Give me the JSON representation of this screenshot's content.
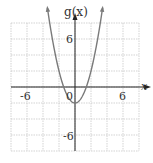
{
  "chart_data": {
    "type": "line",
    "title": "",
    "function_label": "g(x)",
    "xlabel": "x",
    "ylabel": "g(x)",
    "xlim": [
      -8,
      8
    ],
    "ylim": [
      -8,
      8
    ],
    "grid": true,
    "grid_step": 2,
    "x_tick_labels": [
      "-6",
      "6"
    ],
    "y_tick_labels": [
      "6",
      "-6"
    ],
    "origin_label": "0",
    "series": [
      {
        "name": "g(x)",
        "equation_estimate": "x^2 - 2",
        "x": [
          -3.5,
          -3,
          -2,
          -1.41,
          -1,
          0,
          1,
          1.41,
          2,
          3,
          3.5
        ],
        "y": [
          10.25,
          7,
          2,
          0,
          -1,
          -2,
          -1,
          0,
          2,
          7,
          10.25
        ],
        "vertex": [
          0,
          -2
        ],
        "arrows_at_ends": true
      }
    ],
    "colors": {
      "curve": "#7a7a7a",
      "grid": "#c8c8c8",
      "axes": "#222222"
    }
  }
}
